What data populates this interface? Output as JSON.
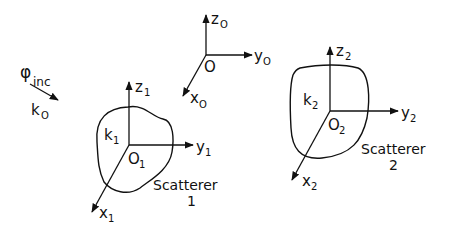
{
  "diagram": {
    "incident": {
      "symbol": "φ",
      "symbol_sub": "inc",
      "wave": "k",
      "wave_sub": "O"
    },
    "global_frame": {
      "z": "z",
      "z_sub": "O",
      "y": "y",
      "y_sub": "O",
      "x": "x",
      "x_sub": "O",
      "origin": "O"
    },
    "scatterer1": {
      "name": "Scatterer",
      "number": "1",
      "k": "k",
      "k_sub": "1",
      "origin": "O",
      "origin_sub": "1",
      "z": "z",
      "z_sub": "1",
      "y": "y",
      "y_sub": "1",
      "x": "x",
      "x_sub": "1"
    },
    "scatterer2": {
      "name": "Scatterer",
      "number": "2",
      "k": "k",
      "k_sub": "2",
      "origin": "O",
      "origin_sub": "2",
      "z": "z",
      "z_sub": "2",
      "y": "y",
      "y_sub": "2",
      "x": "x",
      "x_sub": "2"
    },
    "colors": {
      "ink": "#111111",
      "background": "#ffffff"
    }
  }
}
